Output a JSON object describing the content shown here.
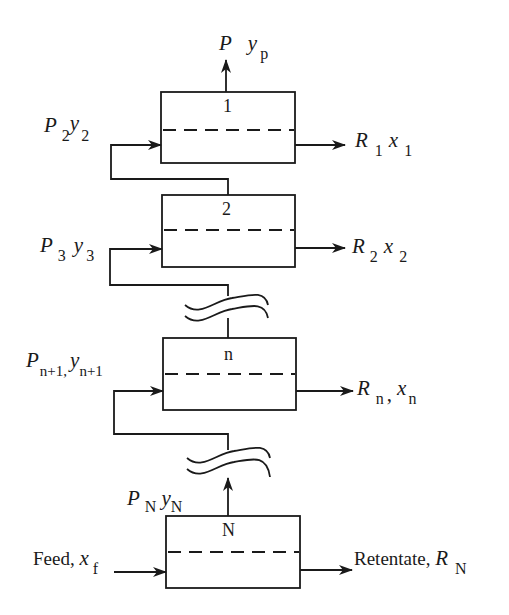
{
  "diagram": {
    "type": "multistage membrane cascade",
    "stages": [
      {
        "id": "1",
        "label": "1"
      },
      {
        "id": "2",
        "label": "2"
      },
      {
        "id": "n",
        "label": "n"
      },
      {
        "id": "N",
        "label": "N"
      }
    ],
    "labels": {
      "permeate_out": {
        "P": "P",
        "y": "y",
        "sub_y": "p"
      },
      "stage1_in": {
        "P": "P",
        "sub_P": "2",
        "y": "y",
        "sub_y": "2"
      },
      "stage1_out": {
        "R": "R",
        "sub_R": "1",
        "x": "x",
        "sub_x": "1"
      },
      "stage2_in": {
        "P": "P",
        "sub_P": "3",
        "y": "y",
        "sub_y": "3"
      },
      "stage2_out": {
        "R": "R",
        "sub_R": "2",
        "x": "x",
        "sub_x": "2"
      },
      "stagen_in": {
        "P": "P",
        "sub_P": "n+1",
        "sep": ",",
        "y": "y",
        "sub_y": "n+1"
      },
      "stagen_out": {
        "R": "R",
        "sub_R": "n",
        "sep": ",",
        "x": "x",
        "sub_x": "n"
      },
      "stageN_perm": {
        "P": "P",
        "sub_P": "N",
        "y": "y",
        "sub_y": "N"
      },
      "feed": {
        "text": "Feed, ",
        "x": "x",
        "sub_x": "f"
      },
      "retentate": {
        "text": "Retentate, ",
        "R": "R",
        "sub_R": "N"
      }
    }
  }
}
